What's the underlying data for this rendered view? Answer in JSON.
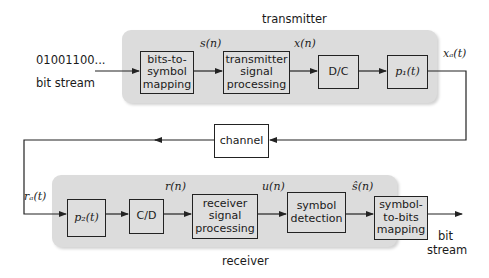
{
  "diagram": {
    "title_transmitter": "transmitter",
    "title_receiver": "receiver",
    "input": {
      "bits": "01001100...",
      "label": "bit stream"
    },
    "output": {
      "line1": "bit",
      "line2": "stream"
    },
    "transmitter_blocks": [
      {
        "id": "bits-to-symbol",
        "lines": [
          "bits-to-",
          "symbol",
          "mapping"
        ]
      },
      {
        "id": "tx-signal-processing",
        "lines": [
          "transmitter",
          "signal",
          "processing"
        ]
      },
      {
        "id": "dc",
        "lines": [
          "D/C"
        ]
      },
      {
        "id": "p1",
        "lines": [
          "p₁(t)"
        ]
      }
    ],
    "channel": {
      "label": "channel"
    },
    "receiver_blocks": [
      {
        "id": "p2",
        "lines": [
          "p₂(t)"
        ]
      },
      {
        "id": "cd",
        "lines": [
          "C/D"
        ]
      },
      {
        "id": "rx-signal-processing",
        "lines": [
          "receiver",
          "signal",
          "processing"
        ]
      },
      {
        "id": "symbol-detection",
        "lines": [
          "symbol",
          "detection"
        ]
      },
      {
        "id": "symbol-to-bits",
        "lines": [
          "symbol-",
          "to-bits",
          "mapping"
        ]
      }
    ],
    "signals": {
      "s_n": "s(n)",
      "x_n": "x(n)",
      "x_a_t": "xₐ(t)",
      "r_a_t": "rₐ(t)",
      "r_n": "r(n)",
      "u_n": "u(n)",
      "s_hat_n": "ŝ(n)"
    },
    "colors": {
      "panel": "#dcdcdc",
      "line": "#222222",
      "background": "#ffffff"
    }
  }
}
